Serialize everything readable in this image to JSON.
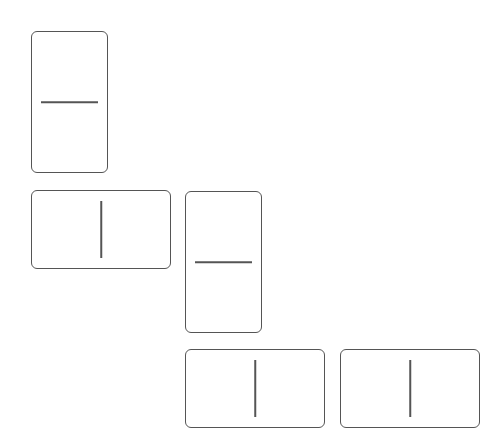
{
  "board": {
    "dominoes": [
      {
        "id": "d1",
        "orientation": "vertical",
        "pips": [
          0,
          0
        ]
      },
      {
        "id": "d2",
        "orientation": "horizontal",
        "pips": [
          0,
          0
        ]
      },
      {
        "id": "d3",
        "orientation": "vertical",
        "pips": [
          0,
          0
        ]
      },
      {
        "id": "d4",
        "orientation": "horizontal",
        "pips": [
          0,
          0
        ]
      },
      {
        "id": "d5",
        "orientation": "horizontal",
        "pips": [
          0,
          0
        ]
      }
    ],
    "colors": {
      "outline": "#555555",
      "face": "#ffffff",
      "background": "#ffffff"
    }
  }
}
